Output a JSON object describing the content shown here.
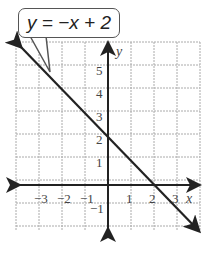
{
  "chart_data": {
    "type": "line",
    "title": "y = −x + 2",
    "equation": "y = −x + 2",
    "slope": -1,
    "intercept": 2,
    "x": [
      -4,
      -3,
      -2,
      -1,
      0,
      1,
      2,
      3,
      4
    ],
    "y": [
      6,
      5,
      4,
      3,
      2,
      1,
      0,
      -1,
      -2
    ],
    "xlabel": "x",
    "ylabel": "y",
    "xlim": [
      -4,
      4
    ],
    "ylim": [
      -2,
      6
    ],
    "x_ticks": [
      "−3",
      "−2",
      "−1",
      "1",
      "2",
      "3"
    ],
    "y_ticks": [
      "5",
      "4",
      "3",
      "2",
      "1",
      "−1"
    ],
    "grid": true,
    "line_color": "#222222",
    "grid_color": "#aaaaaa"
  },
  "labels": {
    "equation": "y = −x + 2",
    "x_axis": "x",
    "y_axis": "y"
  }
}
